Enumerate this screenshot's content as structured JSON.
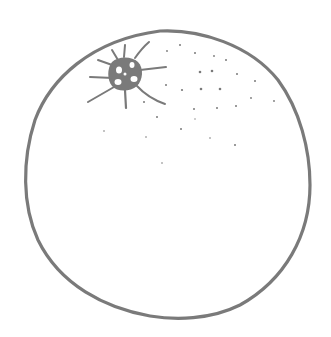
{
  "image": {
    "subject": "orange line drawing",
    "colors": {
      "stroke": "#7a7a7a",
      "background": "#ffffff"
    }
  }
}
